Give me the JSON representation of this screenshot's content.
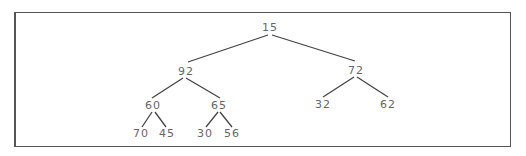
{
  "diagram": {
    "type": "binary-tree",
    "style": {
      "border_color": "#555555",
      "edge_color": "#444444",
      "text_color": "#666666",
      "background": "#ffffff"
    },
    "nodes": [
      {
        "id": "n0",
        "value": "15",
        "x": 270,
        "y": 31
      },
      {
        "id": "n1",
        "value": "92",
        "x": 186,
        "y": 75
      },
      {
        "id": "n2",
        "value": "72",
        "x": 356,
        "y": 74
      },
      {
        "id": "n3",
        "value": "60",
        "x": 153,
        "y": 109
      },
      {
        "id": "n4",
        "value": "65",
        "x": 219,
        "y": 109
      },
      {
        "id": "n5",
        "value": "32",
        "x": 323,
        "y": 108
      },
      {
        "id": "n6",
        "value": "62",
        "x": 388,
        "y": 108
      },
      {
        "id": "n7",
        "value": "70",
        "x": 141,
        "y": 137
      },
      {
        "id": "n8",
        "value": "45",
        "x": 167,
        "y": 137
      },
      {
        "id": "n9",
        "value": "30",
        "x": 205,
        "y": 137
      },
      {
        "id": "n10",
        "value": "56",
        "x": 232,
        "y": 137
      }
    ],
    "edges": [
      {
        "from": "n0",
        "to": "n1",
        "x1": 268,
        "y1": 35,
        "x2": 188,
        "y2": 62
      },
      {
        "from": "n0",
        "to": "n2",
        "x1": 272,
        "y1": 35,
        "x2": 355,
        "y2": 61
      },
      {
        "from": "n1",
        "to": "n3",
        "x1": 183,
        "y1": 78,
        "x2": 152,
        "y2": 98
      },
      {
        "from": "n1",
        "to": "n4",
        "x1": 186,
        "y1": 78,
        "x2": 220,
        "y2": 98
      },
      {
        "from": "n2",
        "to": "n5",
        "x1": 354,
        "y1": 77,
        "x2": 323,
        "y2": 97
      },
      {
        "from": "n2",
        "to": "n6",
        "x1": 357,
        "y1": 77,
        "x2": 388,
        "y2": 97
      },
      {
        "from": "n3",
        "to": "n7",
        "x1": 152,
        "y1": 112,
        "x2": 142,
        "y2": 127
      },
      {
        "from": "n3",
        "to": "n8",
        "x1": 155,
        "y1": 112,
        "x2": 166,
        "y2": 127
      },
      {
        "from": "n4",
        "to": "n9",
        "x1": 218,
        "y1": 112,
        "x2": 206,
        "y2": 127
      },
      {
        "from": "n4",
        "to": "n10",
        "x1": 220,
        "y1": 112,
        "x2": 232,
        "y2": 127
      }
    ]
  }
}
